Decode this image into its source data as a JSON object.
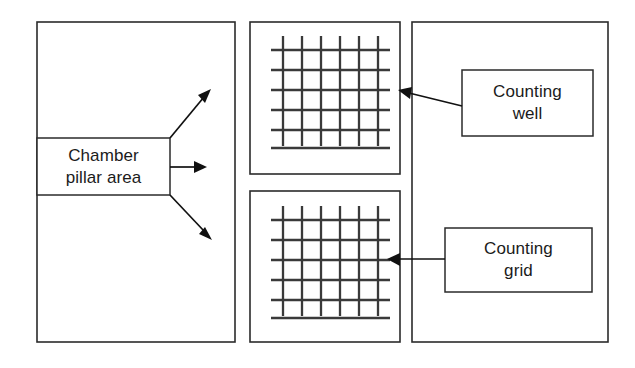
{
  "diagram": {
    "colors": {
      "background": "#ffffff",
      "outline": "#2b2b2b",
      "grid_line": "#3a3a3a",
      "connector": "#111111",
      "text": "#1b1b1b"
    },
    "panels": [
      {
        "name": "chamber-overview-panel",
        "x": 37,
        "y": 22,
        "width": 198,
        "height": 320
      },
      {
        "name": "counting-well-panel",
        "x": 250,
        "y": 22,
        "width": 150,
        "height": 152
      },
      {
        "name": "counting-grid-panel",
        "x": 250,
        "y": 191,
        "width": 150,
        "height": 151
      },
      {
        "name": "callout-panel",
        "x": 412,
        "y": 22,
        "width": 196,
        "height": 320
      }
    ],
    "labels": [
      {
        "name": "chamber-pillar-area",
        "text": "Chamber\npillar area",
        "line1": "Chamber",
        "line2": "pillar area",
        "x": 37,
        "y": 138,
        "width": 133,
        "height": 57
      },
      {
        "name": "counting-well",
        "text": "Counting\nwell",
        "line1": "Counting",
        "line2": "well",
        "x": 462,
        "y": 70,
        "width": 131,
        "height": 66
      },
      {
        "name": "counting-grid",
        "text": "Counting\ngrid",
        "line1": "Counting",
        "line2": "grid",
        "x": 445,
        "y": 228,
        "width": 147,
        "height": 64
      }
    ],
    "grids": [
      {
        "name": "counting-well-grid",
        "vertical_lines": 6,
        "horizontal_lines": 6,
        "x": 271,
        "y": 36,
        "width": 108,
        "height": 110
      },
      {
        "name": "counting-grid-grid",
        "vertical_lines": 6,
        "horizontal_lines": 6,
        "x": 271,
        "y": 206,
        "width": 108,
        "height": 110
      }
    ],
    "connectors": [
      {
        "name": "chamber-arrow-up",
        "from": "chamber-pillar-area",
        "to": "counting-well-panel",
        "direction": "up-right"
      },
      {
        "name": "chamber-arrow-right",
        "from": "chamber-pillar-area",
        "to": "counting-well-panel",
        "direction": "right"
      },
      {
        "name": "chamber-arrow-down",
        "from": "chamber-pillar-area",
        "to": "counting-grid-panel",
        "direction": "down-right"
      },
      {
        "name": "counting-well-callout-arrow",
        "from": "counting-well",
        "to": "counting-well-panel",
        "direction": "left"
      },
      {
        "name": "counting-grid-callout-arrow",
        "from": "counting-grid",
        "to": "counting-grid-panel",
        "direction": "left"
      }
    ]
  }
}
